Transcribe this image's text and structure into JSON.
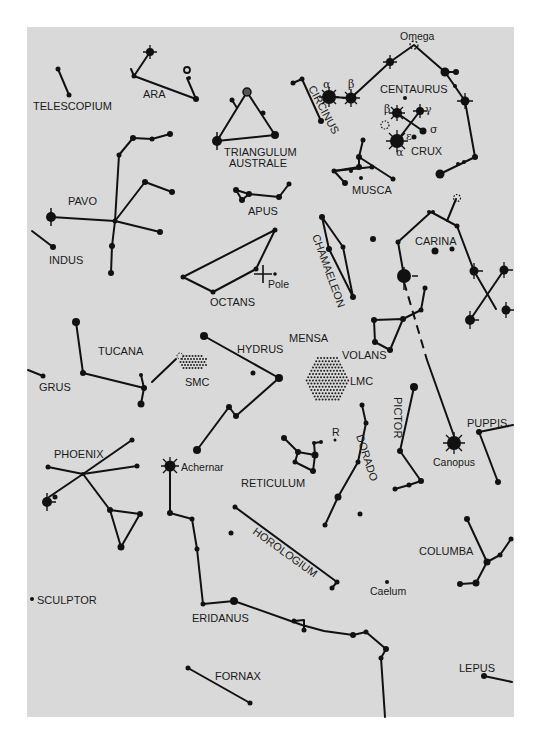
{
  "map": {
    "background": "#d9d9d9",
    "ink": "#111111",
    "constellations": [
      {
        "name": "TELESCOPIUM",
        "label": {
          "x": 33,
          "y": 110
        }
      },
      {
        "name": "ARA",
        "label": {
          "x": 143,
          "y": 98
        }
      },
      {
        "name": "TRIANGULUM",
        "label": {
          "x": 224,
          "y": 156
        }
      },
      {
        "name": "AUSTRALE",
        "label": {
          "x": 229,
          "y": 167
        }
      },
      {
        "name": "CIRCINUS",
        "label": {
          "x": 308,
          "y": 88,
          "rotate": 62
        }
      },
      {
        "name": "CENTAURUS",
        "label": {
          "x": 380,
          "y": 93
        }
      },
      {
        "name": "CRUX",
        "label": {
          "x": 411,
          "y": 155
        }
      },
      {
        "name": "MUSCA",
        "label": {
          "x": 352,
          "y": 194
        }
      },
      {
        "name": "PAVO",
        "label": {
          "x": 68,
          "y": 205
        }
      },
      {
        "name": "APUS",
        "label": {
          "x": 248,
          "y": 215
        }
      },
      {
        "name": "INDUS",
        "label": {
          "x": 49,
          "y": 264
        }
      },
      {
        "name": "CHAMAELEON",
        "label": {
          "x": 312,
          "y": 236,
          "rotate": 70
        }
      },
      {
        "name": "CARINA",
        "label": {
          "x": 415,
          "y": 245
        }
      },
      {
        "name": "OCTANS",
        "label": {
          "x": 210,
          "y": 306
        }
      },
      {
        "name": "MENSA",
        "label": {
          "x": 289,
          "y": 342
        }
      },
      {
        "name": "TUCANA",
        "label": {
          "x": 98,
          "y": 355
        }
      },
      {
        "name": "HYDRUS",
        "label": {
          "x": 237,
          "y": 353
        }
      },
      {
        "name": "VOLANS",
        "label": {
          "x": 342,
          "y": 359
        }
      },
      {
        "name": "SMC",
        "label": {
          "x": 185,
          "y": 386
        }
      },
      {
        "name": "LMC",
        "label": {
          "x": 350,
          "y": 385
        }
      },
      {
        "name": "GRUS",
        "label": {
          "x": 39,
          "y": 391
        }
      },
      {
        "name": "PICTOR",
        "label": {
          "x": 394,
          "y": 397,
          "rotate": 90
        }
      },
      {
        "name": "PUPPIS",
        "label": {
          "x": 467,
          "y": 427
        }
      },
      {
        "name": "DORADO",
        "label": {
          "x": 356,
          "y": 436,
          "rotate": 72
        }
      },
      {
        "name": "PHOENIX",
        "label": {
          "x": 54,
          "y": 458
        }
      },
      {
        "name": "RETICULUM",
        "label": {
          "x": 241,
          "y": 487
        }
      },
      {
        "name": "HOROLOGIUM",
        "label": {
          "x": 252,
          "y": 533,
          "rotate": 36
        }
      },
      {
        "name": "COLUMBA",
        "label": {
          "x": 419,
          "y": 555
        }
      },
      {
        "name": "SCULPTOR",
        "label": {
          "x": 37,
          "y": 604
        }
      },
      {
        "name": "ERIDANUS",
        "label": {
          "x": 192,
          "y": 622
        }
      },
      {
        "name": "FORNAX",
        "label": {
          "x": 215,
          "y": 680
        }
      },
      {
        "name": "LEPUS",
        "label": {
          "x": 459,
          "y": 672
        }
      }
    ],
    "annotations": [
      {
        "text": "Omega",
        "x": 400,
        "y": 40
      },
      {
        "text": "Pole",
        "x": 268,
        "y": 288
      },
      {
        "text": "R",
        "x": 332,
        "y": 436
      },
      {
        "text": "Achernar",
        "x": 181,
        "y": 471
      },
      {
        "text": "Canopus",
        "x": 433,
        "y": 466
      },
      {
        "text": "Caelum",
        "x": 370,
        "y": 595
      }
    ],
    "greek_letters": [
      {
        "text": "α",
        "x": 323,
        "y": 88
      },
      {
        "text": "β",
        "x": 348,
        "y": 88
      },
      {
        "text": "β",
        "x": 384,
        "y": 113
      },
      {
        "text": "γ",
        "x": 425,
        "y": 113
      },
      {
        "text": "σ",
        "x": 430,
        "y": 133
      },
      {
        "text": "ε",
        "x": 406,
        "y": 140
      },
      {
        "text": "α",
        "x": 396,
        "y": 156
      }
    ]
  }
}
